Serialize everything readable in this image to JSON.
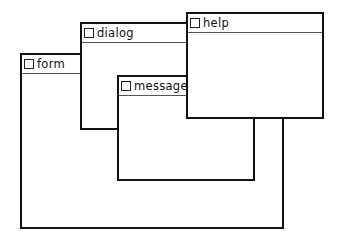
{
  "windows": [
    {
      "id": "form",
      "title": "form",
      "left": 20,
      "top": 53,
      "width": 264,
      "height": 176,
      "z": 1
    },
    {
      "id": "dialog",
      "title": "dialog",
      "left": 80,
      "top": 22,
      "width": 108,
      "height": 108,
      "z": 2
    },
    {
      "id": "message",
      "title": "message",
      "left": 117,
      "top": 75,
      "width": 138,
      "height": 106,
      "z": 3
    },
    {
      "id": "help",
      "title": "help",
      "left": 186,
      "top": 12,
      "width": 138,
      "height": 107,
      "z": 4
    }
  ],
  "colors": {
    "border": "#111111",
    "background": "#ffffff"
  },
  "icons": {
    "close_box": "close-box-icon"
  }
}
